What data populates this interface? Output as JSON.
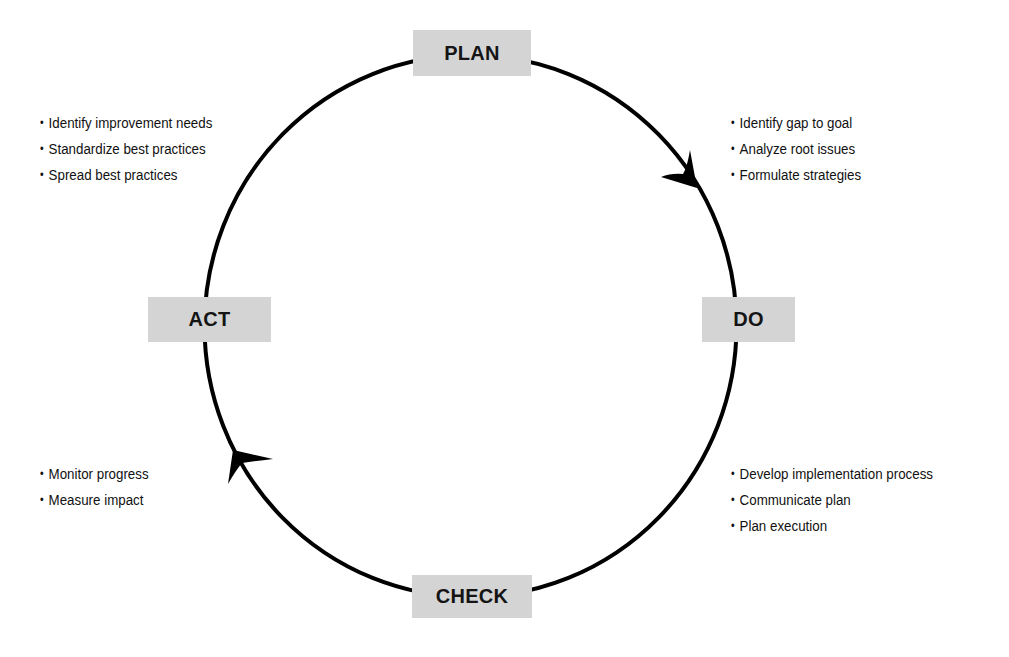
{
  "diagram": {
    "type": "cycle",
    "direction": "clockwise",
    "stages": [
      {
        "id": "plan",
        "label": "PLAN"
      },
      {
        "id": "do",
        "label": "DO"
      },
      {
        "id": "check",
        "label": "CHECK"
      },
      {
        "id": "act",
        "label": "ACT"
      }
    ],
    "notes": {
      "act_top_left": [
        "Identify improvement needs",
        "Standardize best practices",
        "Spread best practices"
      ],
      "plan_top_right": [
        "Identify gap to goal",
        "Analyze root issues",
        "Formulate strategies"
      ],
      "check_bottom_left": [
        "Monitor progress",
        "Measure impact"
      ],
      "do_bottom_right": [
        "Develop implementation process",
        "Communicate plan",
        "Plan execution"
      ]
    },
    "colors": {
      "box_fill": "#d4d4d4",
      "line": "#000000",
      "text": "#111111",
      "background": "#ffffff"
    }
  }
}
